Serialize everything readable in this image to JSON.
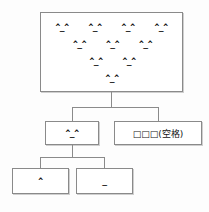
{
  "diagram": {
    "type": "tree",
    "title": "",
    "root": {
      "name": "root-face-cluster",
      "face_glyph": "^_^",
      "pyramid_rows": [
        [
          "^_^",
          "^_^",
          "^_^",
          "^_^"
        ],
        [
          "^_^",
          "^_^",
          "^_^"
        ],
        [
          "^_^",
          "^_^"
        ],
        [
          "^_^"
        ]
      ],
      "total_faces": 10
    },
    "children": [
      {
        "name": "face-node",
        "label": "^_^",
        "children": [
          {
            "name": "caret-node",
            "label": "^"
          },
          {
            "name": "underscore-node",
            "label": "_"
          }
        ]
      },
      {
        "name": "space-node",
        "label": "□□□(空格)",
        "boxes": "□□□",
        "annotation": "(空格)",
        "children": []
      }
    ],
    "colors": {
      "background": "#fdfdfd",
      "box_fill": "#ffffff",
      "box_border": "#8a8a8a",
      "line": "#8a8a8a",
      "text": "#111111"
    }
  }
}
